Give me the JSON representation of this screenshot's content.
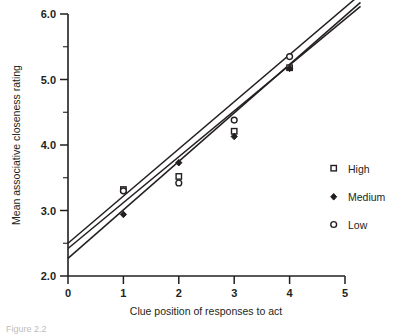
{
  "chart_data": {
    "type": "scatter",
    "title": "",
    "xlabel": "Clue position of responses to act",
    "ylabel": "Mean associative closeness rating",
    "xlim": [
      0,
      5
    ],
    "ylim": [
      2.0,
      6.0
    ],
    "xticks": [
      "0",
      "1",
      "2",
      "3",
      "4",
      "5"
    ],
    "yticks": [
      "2.0",
      "3.0",
      "4.0",
      "5.0",
      "6.0"
    ],
    "yminor_step": 0.5,
    "grid": false,
    "legend_position": "right",
    "x": [
      1,
      2,
      3,
      4
    ],
    "series": [
      {
        "name": "High",
        "marker": "open-square",
        "values": [
          3.32,
          3.52,
          4.21,
          5.18
        ],
        "fit": {
          "intercept": 2.42,
          "slope": 0.7
        }
      },
      {
        "name": "Medium",
        "marker": "filled-diamond",
        "values": [
          2.94,
          3.73,
          4.13,
          5.17
        ],
        "fit": {
          "intercept": 2.27,
          "slope": 0.74
        }
      },
      {
        "name": "Low",
        "marker": "open-circle",
        "values": [
          3.3,
          3.42,
          4.38,
          5.35
        ],
        "fit": {
          "intercept": 2.5,
          "slope": 0.72
        }
      }
    ]
  },
  "axes": {
    "x_title": "Clue position of responses to act",
    "y_title": "Mean associative closeness rating",
    "x_tick_labels": [
      "0",
      "1",
      "2",
      "3",
      "4",
      "5"
    ],
    "y_tick_labels": [
      "2.0",
      "3.0",
      "4.0",
      "5.0",
      "6.0"
    ]
  },
  "legend": {
    "items": [
      {
        "label": "High",
        "marker": "open-square"
      },
      {
        "label": "Medium",
        "marker": "filled-diamond"
      },
      {
        "label": "Low",
        "marker": "open-circle"
      }
    ]
  },
  "caption": {
    "text": "Figure 2.2"
  },
  "colors": {
    "ink": "#231f20",
    "background": "#ffffff",
    "caption": "#bdbdbd"
  }
}
